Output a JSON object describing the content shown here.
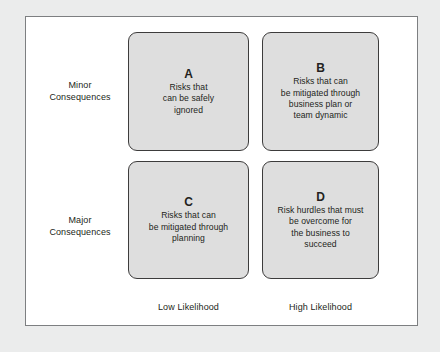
{
  "figure": {
    "type": "risk-assessment-matrix",
    "background_color": "#ebecec",
    "panel_color": "#ffffff",
    "panel_border_color": "#7d7f81",
    "cell_fill_color": "#dedede",
    "cell_border_color": "#3d3c3c",
    "text_color": "#231f20"
  },
  "row_labels": [
    {
      "line1": "Minor",
      "line2": "Consequences"
    },
    {
      "line1": "Major",
      "line2": "Consequences"
    }
  ],
  "column_labels": [
    {
      "text": "Low Likelihood"
    },
    {
      "text": "High Likelihood"
    }
  ],
  "cells": [
    {
      "letter": "A",
      "row": "Minor Consequences",
      "column": "Low Likelihood",
      "lines": [
        "Risks that",
        "can be safely",
        "ignored"
      ]
    },
    {
      "letter": "B",
      "row": "Minor Consequences",
      "column": "High Likelihood",
      "lines": [
        "Risks that can",
        "be mitigated through",
        "business plan or",
        "team dynamic"
      ]
    },
    {
      "letter": "C",
      "row": "Major Consequences",
      "column": "Low Likelihood",
      "lines": [
        "Risks that can",
        "be mitigated through",
        "planning"
      ]
    },
    {
      "letter": "D",
      "row": "Major Consequences",
      "column": "High Likelihood",
      "lines": [
        "Risk hurdles that must",
        "be overcome for",
        "the business to",
        "succeed"
      ]
    }
  ]
}
